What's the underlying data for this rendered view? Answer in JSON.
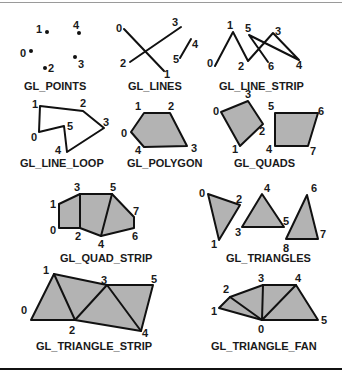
{
  "primitives": {
    "points": {
      "caption": "GL_POINTS",
      "labels": [
        "0",
        "1",
        "2",
        "3",
        "4"
      ]
    },
    "lines": {
      "caption": "GL_LINES",
      "labels": [
        "0",
        "1",
        "2",
        "3",
        "4",
        "5"
      ]
    },
    "line_strip": {
      "caption": "GL_LINE_STRIP",
      "labels": [
        "0",
        "1",
        "2",
        "3",
        "4",
        "5",
        "6"
      ]
    },
    "line_loop": {
      "caption": "GL_LINE_LOOP",
      "labels": [
        "0",
        "1",
        "2",
        "3",
        "4",
        "5"
      ]
    },
    "polygon": {
      "caption": "GL_POLYGON",
      "labels": [
        "0",
        "1",
        "2",
        "3",
        "4"
      ]
    },
    "quads": {
      "caption": "GL_QUADS",
      "labels": [
        "0",
        "1",
        "2",
        "3",
        "4",
        "5",
        "6",
        "7"
      ]
    },
    "quad_strip": {
      "caption": "GL_QUAD_STRIP",
      "labels": [
        "0",
        "1",
        "2",
        "3",
        "4",
        "5",
        "6",
        "7"
      ]
    },
    "triangles": {
      "caption": "GL_TRIANGLES",
      "labels": [
        "0",
        "1",
        "2",
        "3",
        "4",
        "5",
        "6",
        "7",
        "8"
      ]
    },
    "triangle_strip": {
      "caption": "GL_TRIANGLE_STRIP",
      "labels": [
        "0",
        "1",
        "2",
        "3",
        "4",
        "5"
      ]
    },
    "triangle_fan": {
      "caption": "GL_TRIANGLE_FAN",
      "labels": [
        "0",
        "1",
        "2",
        "3",
        "4",
        "5"
      ]
    }
  },
  "colors": {
    "fill": "#b3b3b3",
    "stroke": "#111111"
  }
}
